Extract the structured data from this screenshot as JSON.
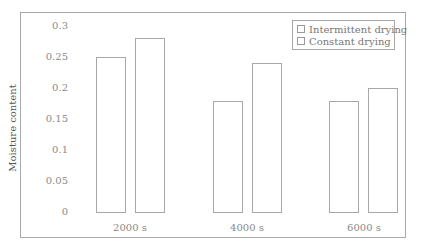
{
  "chart_data": {
    "type": "bar",
    "title": "",
    "xlabel": "",
    "ylabel": "Moisture content",
    "categories": [
      "2000 s",
      "4000 s",
      "6000 s"
    ],
    "series": [
      {
        "name": "Intermittent drying",
        "values": [
          0.25,
          0.18,
          0.18
        ]
      },
      {
        "name": "Constant drying",
        "values": [
          0.28,
          0.24,
          0.2
        ]
      }
    ],
    "ylim": [
      0,
      0.3
    ],
    "yticks": [
      "0",
      "0.05",
      "0.1",
      "0.15",
      "0.2",
      "0.25",
      "0.3"
    ],
    "grid": false,
    "legend_position": "top-right"
  },
  "legend": {
    "items": [
      {
        "label": "Intermittent drying"
      },
      {
        "label": "Constant drying"
      }
    ]
  },
  "colors": {
    "bar_outline": "#a8a8a8",
    "bar_fill": "#ffffff"
  }
}
